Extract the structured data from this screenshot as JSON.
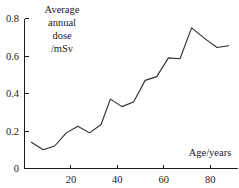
{
  "chart_data": {
    "type": "line",
    "title": "",
    "subtitle": "",
    "xlabel": "Age/years",
    "ylabel": "Average annual dose /mSv",
    "ylabel_lines": [
      "Average",
      "annual",
      "dose",
      "/mSv"
    ],
    "xlim": [
      0,
      92
    ],
    "ylim": [
      0,
      0.8
    ],
    "x_ticks": [
      20,
      40,
      60,
      80
    ],
    "x_tick_labels": [
      "20",
      "40",
      "60",
      "80"
    ],
    "y_ticks": [
      0,
      0.2,
      0.4,
      0.6,
      0.8
    ],
    "y_tick_labels": [
      "0",
      "0.2",
      "0.4",
      "0.6",
      "0.8"
    ],
    "grid": false,
    "legend": false,
    "legend_position": "none",
    "tick_direction": "inward",
    "line_color": "#2b2b2b",
    "axis_color": "#1a1a1a",
    "background_color": "#ffffff",
    "series": [
      {
        "name": "Average annual dose",
        "x": [
          3,
          8,
          13,
          18,
          23,
          28,
          33,
          37,
          42,
          47,
          52,
          57,
          62,
          67,
          72,
          78,
          83,
          88
        ],
        "values": [
          0.14,
          0.1,
          0.12,
          0.19,
          0.225,
          0.19,
          0.235,
          0.37,
          0.33,
          0.355,
          0.47,
          0.49,
          0.59,
          0.585,
          0.75,
          0.69,
          0.645,
          0.655
        ]
      }
    ]
  },
  "labels": {
    "x_axis_title": "Age/years",
    "y_axis_title_line1": "Average",
    "y_axis_title_line2": "annual",
    "y_axis_title_line3": "dose",
    "y_axis_title_line4": "/mSv",
    "y_tick_0": "0",
    "y_tick_1": "0.2",
    "y_tick_2": "0.4",
    "y_tick_3": "0.6",
    "y_tick_4": "0.8",
    "x_tick_0": "20",
    "x_tick_1": "40",
    "x_tick_2": "60",
    "x_tick_3": "80"
  }
}
